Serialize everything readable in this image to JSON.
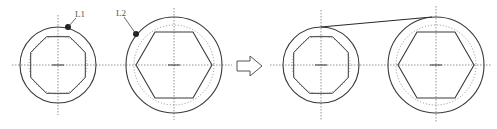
{
  "diagram": {
    "colors": {
      "stroke": "#3a3a3a",
      "dotted": "#777777",
      "center": "#555555",
      "background": "#ffffff"
    },
    "before": {
      "left": {
        "label": "L1",
        "shape": "octagon",
        "cx": 58,
        "cy": 65,
        "outer_r": 38,
        "dotted_r": 28,
        "inner_r": 30
      },
      "right": {
        "label": "L2",
        "shape": "hexagon",
        "cx": 174,
        "cy": 65,
        "outer_r": 48,
        "dotted_r": 40,
        "inner_r": 37
      }
    },
    "arrow": {
      "direction": "right",
      "symbol": "hollow-arrow"
    },
    "after": {
      "left": {
        "shape": "octagon",
        "cx": 321,
        "cy": 65,
        "outer_r": 38
      },
      "right": {
        "shape": "hexagon",
        "cx": 436,
        "cy": 65,
        "outer_r": 48
      },
      "connector": "tangent-line"
    }
  }
}
